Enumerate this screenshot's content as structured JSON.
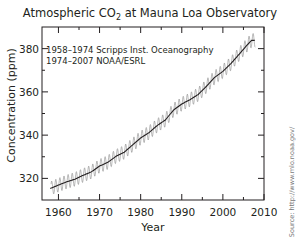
{
  "chart_data": {
    "type": "line",
    "title": "Atmospheric CO2 at Mauna Loa Observatory",
    "title_parts": {
      "pre": "Atmospheric CO",
      "sub": "2",
      "post": " at Mauna Loa Observatory"
    },
    "xlabel": "Year",
    "ylabel": "Concentration (ppm)",
    "xlim": [
      1956,
      2010
    ],
    "ylim": [
      310,
      390
    ],
    "x_ticks": [
      1960,
      1970,
      1980,
      1990,
      2000,
      2010
    ],
    "y_ticks": [
      320,
      340,
      360,
      380
    ],
    "grid": false,
    "legend": {
      "position": "upper-left",
      "entries": [
        "1958–1974 Scripps Inst. Oceanography",
        "1974–2007 NOAA/ESRL"
      ]
    },
    "series": [
      {
        "name": "Annual mean (smoothed)",
        "color": "#231f20",
        "x": [
          1958,
          1960,
          1962,
          1964,
          1966,
          1968,
          1970,
          1972,
          1974,
          1976,
          1978,
          1980,
          1982,
          1984,
          1986,
          1988,
          1990,
          1992,
          1994,
          1996,
          1998,
          2000,
          2002,
          2004,
          2006,
          2007
        ],
        "values": [
          315.3,
          316.9,
          318.4,
          319.6,
          321.4,
          323.0,
          325.7,
          327.4,
          330.2,
          332.1,
          335.4,
          338.7,
          341.1,
          344.4,
          347.0,
          351.6,
          354.4,
          356.4,
          358.8,
          362.6,
          366.7,
          369.5,
          373.2,
          377.5,
          381.9,
          383.8
        ]
      },
      {
        "name": "Monthly (seasonal cycle)",
        "color": "#8a8a8a",
        "seasonal_amplitude_ppm": 3.2
      }
    ],
    "annotations": [
      "Source: http://www.mlo.noaa.gov/"
    ]
  },
  "labels": {
    "ylabel": "Concentration (ppm)",
    "xlabel": "Year",
    "legend_1": "1958–1974 Scripps Inst. Oceanography",
    "legend_2": "1974–2007 NOAA/ESRL",
    "source": "Source: http://www.mlo.noaa.gov/"
  }
}
